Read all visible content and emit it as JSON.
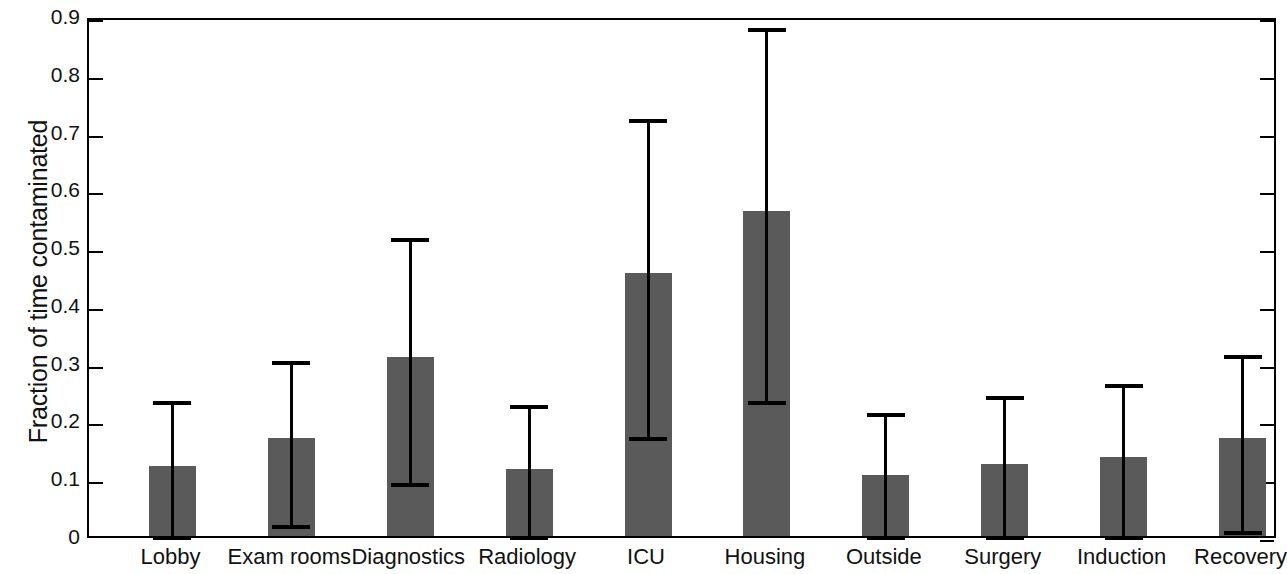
{
  "chart_data": {
    "type": "bar",
    "title": "",
    "xlabel": "",
    "ylabel": "Fraction of time contaminated",
    "ylim": [
      0,
      0.9
    ],
    "ytick_labels": [
      "0",
      "0.1",
      "0.2",
      "0.3",
      "0.4",
      "0.5",
      "0.6",
      "0.7",
      "0.8",
      "0.9"
    ],
    "ytick_values": [
      0,
      0.1,
      0.2,
      0.3,
      0.4,
      0.5,
      0.6,
      0.7,
      0.8,
      0.9
    ],
    "grid": false,
    "legend": null,
    "bar_color": "#5a5a5a",
    "error_bar_color": "#000000",
    "categories": [
      "Lobby",
      "Exam rooms",
      "Diagnostics",
      "Radiology",
      "ICU",
      "Housing",
      "Outside",
      "Surgery",
      "Induction",
      "Recovery"
    ],
    "values": [
      0.122,
      0.17,
      0.31,
      0.116,
      0.455,
      0.562,
      0.106,
      0.124,
      0.136,
      0.169
    ],
    "error_upper": [
      0.24,
      0.31,
      0.522,
      0.234,
      0.728,
      0.886,
      0.22,
      0.25,
      0.27,
      0.321
    ],
    "error_lower": [
      0.0,
      0.026,
      0.098,
      0.0,
      0.178,
      0.24,
      0.0,
      0.0,
      0.004,
      0.016
    ],
    "series": [
      {
        "name": "Fraction of time contaminated",
        "values": [
          0.122,
          0.17,
          0.31,
          0.116,
          0.455,
          0.562,
          0.106,
          0.124,
          0.136,
          0.169
        ]
      }
    ]
  }
}
